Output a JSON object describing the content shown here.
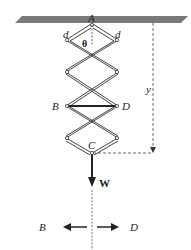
{
  "figure": {
    "type": "scissor-linkage mechanics diagram",
    "labels": {
      "top_pivot": "A",
      "link_length_left": "d",
      "link_length_right": "d",
      "angle": "θ",
      "left_joint": "B",
      "right_joint": "D",
      "bottom_joint": "C",
      "distance": "y",
      "weight": "W",
      "fbd_left": "B",
      "fbd_right": "D"
    },
    "colors": {
      "ceiling": "#7a7a7a",
      "lines": "#333333",
      "background": "#ffffff"
    }
  }
}
